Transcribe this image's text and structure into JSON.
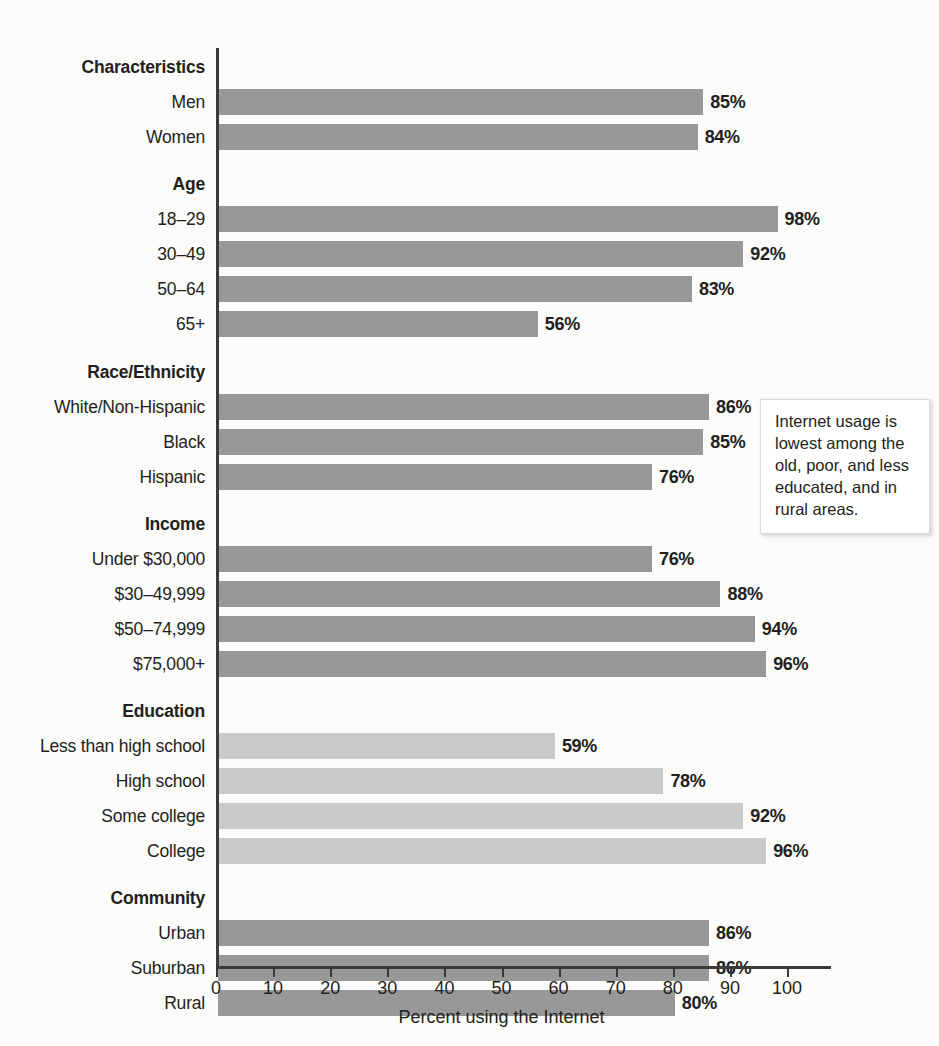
{
  "chart_data": {
    "type": "bar",
    "orientation": "horizontal",
    "title": "",
    "xlabel": "Percent using the Internet",
    "ylabel": "",
    "xlim": [
      0,
      100
    ],
    "xticks": [
      0,
      10,
      20,
      30,
      40,
      50,
      60,
      70,
      80,
      90,
      100
    ],
    "xtick_labels": [
      "0",
      "10",
      "20",
      "30",
      "40",
      "50",
      "60",
      "70",
      "80",
      "90",
      "100"
    ],
    "grid": false,
    "legend": false,
    "value_label_suffix": "%",
    "colors": {
      "bar_default": "#989898",
      "bar_highlight": "#cacaca",
      "text": "#231f20",
      "axis": "#3a3a3a",
      "background": "#fbfbfa"
    },
    "groups": [
      {
        "heading": "Characteristics",
        "style": "default",
        "rows": [
          {
            "category": "Men",
            "value": 85,
            "label": "85%"
          },
          {
            "category": "Women",
            "value": 84,
            "label": "84%"
          }
        ]
      },
      {
        "heading": "Age",
        "style": "default",
        "rows": [
          {
            "category": "18–29",
            "value": 98,
            "label": "98%"
          },
          {
            "category": "30–49",
            "value": 92,
            "label": "92%"
          },
          {
            "category": "50–64",
            "value": 83,
            "label": "83%"
          },
          {
            "category": "65+",
            "value": 56,
            "label": "56%"
          }
        ]
      },
      {
        "heading": "Race/Ethnicity",
        "style": "default",
        "rows": [
          {
            "category": "White/Non-Hispanic",
            "value": 86,
            "label": "86%"
          },
          {
            "category": "Black",
            "value": 85,
            "label": "85%"
          },
          {
            "category": "Hispanic",
            "value": 76,
            "label": "76%"
          }
        ]
      },
      {
        "heading": "Income",
        "style": "default",
        "rows": [
          {
            "category": "Under $30,000",
            "value": 76,
            "label": "76%"
          },
          {
            "category": "$30–49,999",
            "value": 88,
            "label": "88%"
          },
          {
            "category": "$50–74,999",
            "value": 94,
            "label": "94%"
          },
          {
            "category": "$75,000+",
            "value": 96,
            "label": "96%"
          }
        ]
      },
      {
        "heading": "Education",
        "style": "highlight",
        "rows": [
          {
            "category": "Less than high school",
            "value": 59,
            "label": "59%"
          },
          {
            "category": "High school",
            "value": 78,
            "label": "78%"
          },
          {
            "category": "Some college",
            "value": 92,
            "label": "92%"
          },
          {
            "category": "College",
            "value": 96,
            "label": "96%"
          }
        ]
      },
      {
        "heading": "Community",
        "style": "default",
        "rows": [
          {
            "category": "Urban",
            "value": 86,
            "label": "86%"
          },
          {
            "category": "Suburban",
            "value": 86,
            "label": "86%"
          },
          {
            "category": "Rural",
            "value": 80,
            "label": "80%"
          }
        ]
      }
    ],
    "annotations": [
      {
        "id": "callout",
        "text": "Internet usage is lowest among the old, poor, and less educated, and in rural areas."
      }
    ]
  }
}
